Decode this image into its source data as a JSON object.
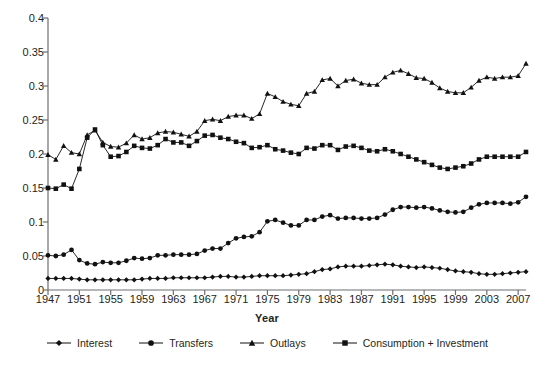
{
  "chart_data": {
    "type": "line",
    "title": "",
    "xlabel": "Year",
    "ylabel": "",
    "xlim": [
      1947,
      2008
    ],
    "ylim": [
      0,
      0.4
    ],
    "grid": false,
    "legend_position": "bottom",
    "y_ticks": [
      0,
      0.05,
      0.1,
      0.15,
      0.2,
      0.25,
      0.3,
      0.35,
      0.4
    ],
    "y_tick_labels": [
      "0",
      "0.05",
      "0.1",
      "0.15",
      "0.2",
      "0.25",
      "0.3",
      "0.35",
      "0.4"
    ],
    "x_ticks": [
      1947,
      1951,
      1955,
      1959,
      1963,
      1967,
      1971,
      1975,
      1979,
      1983,
      1987,
      1991,
      1995,
      1999,
      2003,
      2007
    ],
    "x_tick_labels": [
      "1947",
      "1951",
      "1955",
      "1959",
      "1963",
      "1967",
      "1971",
      "1975",
      "1979",
      "1983",
      "1987",
      "1991",
      "1995",
      "1999",
      "2003",
      "2007"
    ],
    "x": [
      1947,
      1948,
      1949,
      1950,
      1951,
      1952,
      1953,
      1954,
      1955,
      1956,
      1957,
      1958,
      1959,
      1960,
      1961,
      1962,
      1963,
      1964,
      1965,
      1966,
      1967,
      1968,
      1969,
      1970,
      1971,
      1972,
      1973,
      1974,
      1975,
      1976,
      1977,
      1978,
      1979,
      1980,
      1981,
      1982,
      1983,
      1984,
      1985,
      1986,
      1987,
      1988,
      1989,
      1990,
      1991,
      1992,
      1993,
      1994,
      1995,
      1996,
      1997,
      1998,
      1999,
      2000,
      2001,
      2002,
      2003,
      2004,
      2005,
      2006,
      2007,
      2008
    ],
    "series": [
      {
        "name": "Interest",
        "marker": "diamond",
        "values": [
          0.017,
          0.017,
          0.017,
          0.017,
          0.016,
          0.015,
          0.015,
          0.015,
          0.015,
          0.015,
          0.015,
          0.015,
          0.016,
          0.017,
          0.017,
          0.017,
          0.018,
          0.018,
          0.018,
          0.018,
          0.018,
          0.019,
          0.02,
          0.02,
          0.019,
          0.019,
          0.02,
          0.021,
          0.021,
          0.021,
          0.021,
          0.022,
          0.023,
          0.024,
          0.027,
          0.03,
          0.031,
          0.034,
          0.035,
          0.035,
          0.035,
          0.036,
          0.037,
          0.038,
          0.037,
          0.035,
          0.034,
          0.033,
          0.034,
          0.033,
          0.032,
          0.03,
          0.028,
          0.027,
          0.026,
          0.024,
          0.023,
          0.023,
          0.024,
          0.025,
          0.026,
          0.027
        ]
      },
      {
        "name": "Transfers",
        "marker": "circle",
        "values": [
          0.051,
          0.05,
          0.052,
          0.059,
          0.044,
          0.039,
          0.038,
          0.041,
          0.04,
          0.04,
          0.043,
          0.047,
          0.046,
          0.047,
          0.051,
          0.051,
          0.052,
          0.052,
          0.052,
          0.053,
          0.058,
          0.061,
          0.061,
          0.069,
          0.076,
          0.078,
          0.079,
          0.085,
          0.101,
          0.103,
          0.099,
          0.095,
          0.095,
          0.103,
          0.103,
          0.108,
          0.11,
          0.105,
          0.106,
          0.106,
          0.105,
          0.105,
          0.106,
          0.111,
          0.118,
          0.122,
          0.122,
          0.121,
          0.122,
          0.12,
          0.117,
          0.115,
          0.114,
          0.115,
          0.121,
          0.126,
          0.128,
          0.128,
          0.128,
          0.127,
          0.129,
          0.137
        ]
      },
      {
        "name": "Outlays",
        "marker": "triangle",
        "values": [
          0.199,
          0.192,
          0.212,
          0.202,
          0.2,
          0.228,
          0.235,
          0.217,
          0.211,
          0.21,
          0.216,
          0.228,
          0.222,
          0.224,
          0.231,
          0.233,
          0.232,
          0.229,
          0.226,
          0.233,
          0.249,
          0.251,
          0.249,
          0.255,
          0.257,
          0.257,
          0.252,
          0.259,
          0.289,
          0.284,
          0.277,
          0.273,
          0.271,
          0.289,
          0.292,
          0.309,
          0.311,
          0.3,
          0.308,
          0.31,
          0.304,
          0.302,
          0.302,
          0.313,
          0.32,
          0.323,
          0.318,
          0.312,
          0.311,
          0.305,
          0.297,
          0.292,
          0.29,
          0.29,
          0.298,
          0.308,
          0.313,
          0.311,
          0.313,
          0.313,
          0.315,
          0.333
        ]
      },
      {
        "name": "Consumption + Investment",
        "marker": "square",
        "values": [
          0.15,
          0.149,
          0.155,
          0.149,
          0.178,
          0.224,
          0.236,
          0.213,
          0.196,
          0.197,
          0.203,
          0.212,
          0.209,
          0.208,
          0.213,
          0.222,
          0.217,
          0.217,
          0.212,
          0.219,
          0.227,
          0.228,
          0.224,
          0.222,
          0.218,
          0.216,
          0.209,
          0.21,
          0.213,
          0.207,
          0.205,
          0.202,
          0.2,
          0.209,
          0.208,
          0.213,
          0.213,
          0.206,
          0.211,
          0.212,
          0.209,
          0.205,
          0.204,
          0.207,
          0.204,
          0.2,
          0.196,
          0.192,
          0.188,
          0.184,
          0.18,
          0.178,
          0.18,
          0.182,
          0.186,
          0.192,
          0.196,
          0.196,
          0.196,
          0.196,
          0.196,
          0.203
        ]
      }
    ]
  },
  "axis_title": {
    "x": "Year"
  },
  "legend": {
    "items": [
      {
        "label": "Interest",
        "marker": "diamond"
      },
      {
        "label": "Transfers",
        "marker": "circle"
      },
      {
        "label": "Outlays",
        "marker": "triangle"
      },
      {
        "label": "Consumption + Investment",
        "marker": "square"
      }
    ]
  },
  "colors": {
    "ink": "#231f20",
    "axis": "#6d6e71",
    "series": "#111111"
  }
}
